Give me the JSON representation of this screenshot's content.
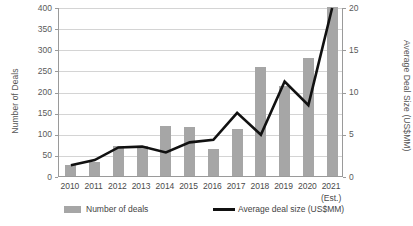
{
  "chart_data": {
    "type": "bar",
    "title": "",
    "xlabel": "",
    "ylabel": "Number of Deals",
    "y2label": "Average Deal Size (US$MM)",
    "categories": [
      "2010",
      "2011",
      "2012",
      "2013",
      "2014",
      "2015",
      "2016",
      "2017",
      "2018",
      "2019",
      "2020",
      "2021"
    ],
    "category_sublabels": [
      "",
      "",
      "",
      "",
      "",
      "",
      "",
      "",
      "",
      "",
      "",
      "(Est.)"
    ],
    "ylim": [
      0,
      400
    ],
    "y2lim": [
      0,
      20
    ],
    "y_ticks": [
      0,
      50,
      100,
      150,
      200,
      250,
      300,
      350,
      400
    ],
    "y2_ticks": [
      0,
      5,
      10,
      15,
      20
    ],
    "grid": true,
    "legend_position": "bottom",
    "series": [
      {
        "name": "Number of deals",
        "type": "bar",
        "axis": "left",
        "color": "#a6a6a6",
        "values": [
          25,
          33,
          70,
          70,
          118,
          115,
          63,
          112,
          258,
          213,
          280,
          400
        ]
      },
      {
        "name": "Average deal size (US$MM)",
        "type": "line",
        "axis": "right",
        "color": "#111111",
        "values": [
          1.4,
          2.0,
          3.5,
          3.6,
          2.9,
          4.1,
          4.4,
          7.6,
          5.0,
          11.3,
          8.5,
          20.0
        ]
      }
    ]
  },
  "axes": {
    "left_title": "Number of Deals",
    "right_title": "Average Deal Size (US$MM)"
  },
  "legend": {
    "bars_label": "Number of deals",
    "line_label": "Average deal size (US$MM)"
  }
}
